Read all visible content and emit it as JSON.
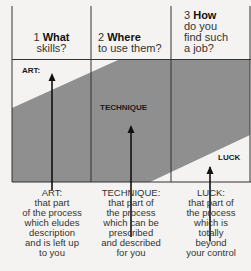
{
  "columns": [
    {
      "number": "1",
      "keyword": "What",
      "rest": "skills?"
    },
    {
      "number": "2",
      "keyword": "Where",
      "rest": "to use them?"
    },
    {
      "number": "3",
      "keyword": "How",
      "rest_lines": [
        "do you",
        "find such",
        "a job?"
      ]
    }
  ],
  "zones": {
    "art": "ART:",
    "technique": "TECHNIQUE",
    "luck": "LUCK"
  },
  "captions": [
    {
      "title": "ART:",
      "lines": [
        "that part",
        "of the process",
        "which eludes",
        "description",
        "and is left up",
        "to you"
      ]
    },
    {
      "title": "TECHNIQUE:",
      "lines": [
        "that part of",
        "the process",
        "which can be",
        "prescribed",
        "and described",
        "for you"
      ]
    },
    {
      "title": "LUCK:",
      "lines": [
        "that part of",
        "the process",
        "which is",
        "totally",
        "beyond",
        "your control"
      ]
    }
  ],
  "colors": {
    "band": "#8f8f8f",
    "paper": "#f4f3f1",
    "line": "#333333"
  }
}
